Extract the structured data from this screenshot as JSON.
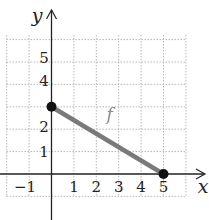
{
  "chart_data": {
    "type": "line",
    "title": "",
    "xlabel": "x",
    "ylabel": "y",
    "series": [
      {
        "name": "f",
        "points": [
          [
            0,
            3
          ],
          [
            5,
            0
          ]
        ],
        "endpoints": "closed",
        "color": "#7a7a7a"
      }
    ],
    "x_tick_labels": [
      "−1",
      "1",
      "2",
      "3",
      "4",
      "5"
    ],
    "x_ticks": [
      -1,
      1,
      2,
      3,
      4,
      5
    ],
    "y_tick_labels": [
      "1",
      "2",
      "4",
      "5"
    ],
    "y_ticks": [
      1,
      2,
      4,
      5
    ],
    "xlim": [
      -2,
      6
    ],
    "ylim": [
      -1,
      6
    ],
    "grid": true,
    "grid_style": "dotted",
    "legend": "none",
    "annotations": [
      {
        "text": "f",
        "x": 2.6,
        "y": 2.4
      }
    ]
  },
  "colors": {
    "axis": "#222222",
    "grid": "#b8b8b8",
    "line": "#7a7a7a",
    "point": "#111111",
    "label": "#222222",
    "f_label": "#8a8a8a"
  }
}
